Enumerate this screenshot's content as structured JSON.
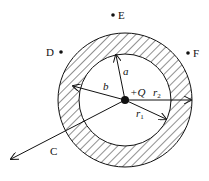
{
  "diagram": {
    "title": "",
    "center_charge": "+Q",
    "labels": {
      "a": "a",
      "b": "b",
      "r1": "r",
      "r1_sub": "1",
      "r2": "r",
      "r2_sub": "2",
      "C": "C",
      "D": "D",
      "E": "E",
      "F": "F"
    },
    "colors": {
      "line": "#111111",
      "background": "#ffffff"
    }
  }
}
